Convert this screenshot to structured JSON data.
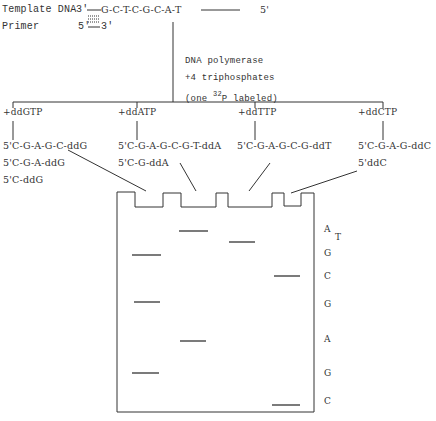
{
  "header": {
    "template_label": "Template DNA",
    "template_3prime": "3'",
    "template_seq": "G-C-T-C-G-C-A-T",
    "template_5prime": "5'",
    "primer_label": "Primer",
    "primer_5prime": "5'",
    "primer_3prime": "3'"
  },
  "reaction": {
    "line1": "DNA polymerase",
    "line2": "+4 triphosphates",
    "line3_pre": "(one ",
    "line3_sup": "32",
    "line3_post": "P labeled)"
  },
  "tubes": [
    {
      "label": "+ddGTP",
      "products": [
        "5'C-G-A-G-C-ddG",
        "5'C-G-A-ddG",
        "5'C-ddG"
      ]
    },
    {
      "label": "+ddATP",
      "products": [
        "5'C-G-A-G-C-G-T-ddA",
        "5'C-G-ddA"
      ]
    },
    {
      "label": "+ddTTP",
      "products": [
        "5'C-G-A-G-C-G-ddT"
      ]
    },
    {
      "label": "+ddCTP",
      "products": [
        "5'C-G-A-G-ddC",
        "5'ddC"
      ]
    }
  ],
  "gel": {
    "read_sequence": [
      "A",
      "T",
      "G",
      "C",
      "G",
      "A",
      "G",
      "C"
    ],
    "bands": [
      {
        "lane": "G",
        "y": 255
      },
      {
        "lane": "G",
        "y": 302
      },
      {
        "lane": "G",
        "y": 373
      },
      {
        "lane": "A",
        "y": 231
      },
      {
        "lane": "A",
        "y": 341
      },
      {
        "lane": "T",
        "y": 242
      },
      {
        "lane": "C",
        "y": 276
      },
      {
        "lane": "C",
        "y": 405
      }
    ]
  }
}
